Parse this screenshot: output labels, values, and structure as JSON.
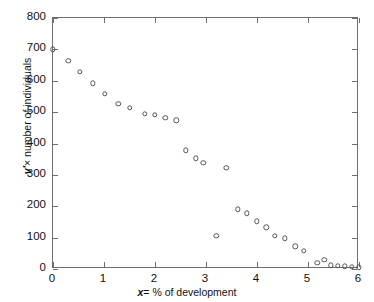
{
  "chart_data": {
    "type": "scatter",
    "title": "",
    "xlabel": "x = % of development",
    "ylabel": "v' × number of individuals",
    "xlim": [
      0,
      6
    ],
    "ylim": [
      0,
      800
    ],
    "xticks": [
      0,
      1,
      2,
      3,
      4,
      5,
      6
    ],
    "yticks": [
      0,
      100,
      200,
      300,
      400,
      500,
      600,
      700,
      800
    ],
    "grid": false,
    "legend": null,
    "marker": "open-circle",
    "marker_color": "#555555",
    "points": [
      {
        "x": 0.0,
        "y": 700
      },
      {
        "x": 0.3,
        "y": 663
      },
      {
        "x": 0.52,
        "y": 628
      },
      {
        "x": 0.78,
        "y": 592
      },
      {
        "x": 1.02,
        "y": 558
      },
      {
        "x": 1.28,
        "y": 527
      },
      {
        "x": 1.5,
        "y": 514
      },
      {
        "x": 1.8,
        "y": 495
      },
      {
        "x": 2.0,
        "y": 492
      },
      {
        "x": 2.2,
        "y": 482
      },
      {
        "x": 2.42,
        "y": 474
      },
      {
        "x": 2.6,
        "y": 378
      },
      {
        "x": 2.8,
        "y": 353
      },
      {
        "x": 2.95,
        "y": 338
      },
      {
        "x": 3.2,
        "y": 105
      },
      {
        "x": 3.4,
        "y": 322
      },
      {
        "x": 3.62,
        "y": 190
      },
      {
        "x": 3.8,
        "y": 178
      },
      {
        "x": 4.0,
        "y": 152
      },
      {
        "x": 4.18,
        "y": 133
      },
      {
        "x": 4.35,
        "y": 105
      },
      {
        "x": 4.55,
        "y": 98
      },
      {
        "x": 4.75,
        "y": 72
      },
      {
        "x": 4.92,
        "y": 58
      },
      {
        "x": 5.18,
        "y": 20
      },
      {
        "x": 5.32,
        "y": 30
      },
      {
        "x": 5.45,
        "y": 12
      },
      {
        "x": 5.58,
        "y": 10
      },
      {
        "x": 5.72,
        "y": 8
      },
      {
        "x": 5.86,
        "y": 7
      },
      {
        "x": 6.0,
        "y": 5
      }
    ]
  },
  "axis": {
    "x_title_prefix": "x",
    "x_title_rest": "= % of development",
    "y_title_prefix": "v′",
    "y_title_rest": "× number of individuals"
  }
}
